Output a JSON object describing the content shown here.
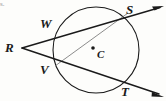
{
  "figure": {
    "caption_fragment": "s.",
    "canvas": {
      "width": 166,
      "height": 101,
      "background": "#fdfdfb"
    },
    "stroke_color": "#1a1a1a",
    "chord_color": "#6e6e6e",
    "circle": {
      "name": "circle-C",
      "center_label": "C",
      "center_x": 96,
      "center_y": 50,
      "radius": 43
    },
    "points": [
      {
        "label": "R",
        "x": 22,
        "y": 48,
        "role": "external-vertex"
      },
      {
        "label": "W",
        "x": 58,
        "y": 28,
        "role": "near-intersection-upper"
      },
      {
        "label": "S",
        "x": 128,
        "y": 13,
        "role": "far-intersection-upper"
      },
      {
        "label": "V",
        "x": 55,
        "y": 66,
        "role": "near-intersection-lower"
      },
      {
        "label": "T",
        "x": 131,
        "y": 88,
        "role": "far-intersection-lower"
      },
      {
        "label": "C",
        "x": 93,
        "y": 48,
        "role": "center"
      }
    ],
    "segments": [
      {
        "name": "secant-RWS",
        "from": "R",
        "to": "S",
        "through": "W",
        "arrow": true,
        "weight": "thick"
      },
      {
        "name": "secant-RVT",
        "from": "R",
        "to": "T",
        "through": "V",
        "arrow": true,
        "weight": "thick"
      },
      {
        "name": "chord-VS",
        "from": "V",
        "to": "S",
        "through": "",
        "arrow": false,
        "weight": "thin"
      }
    ],
    "arrow_tips": [
      {
        "name": "arrow-upper-right",
        "x": 163,
        "y": 6
      },
      {
        "name": "arrow-lower-right",
        "x": 163,
        "y": 97
      }
    ]
  }
}
